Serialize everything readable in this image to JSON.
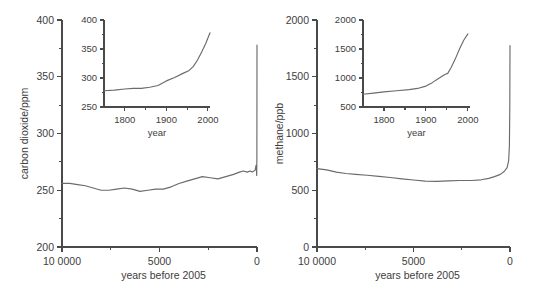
{
  "figure": {
    "background": "#ffffff",
    "line_color": "#6b6b6b",
    "axis_color": "#4a4a4a",
    "text_color": "#3d3d3d"
  },
  "chart_data": [
    {
      "id": "co2-main",
      "type": "line",
      "title": "",
      "xlabel": "years before 2005",
      "ylabel": "carbon dioxide/ppm",
      "xlim": [
        100000,
        0
      ],
      "ylim": [
        200,
        400
      ],
      "x_ticks": [
        100000,
        50000,
        0
      ],
      "x_tick_labels": [
        "10 0000",
        "5000",
        "0"
      ],
      "x_minor_ticks": [
        75000,
        25000
      ],
      "y_ticks": [
        200,
        250,
        300,
        350,
        400
      ],
      "y_tick_labels": [
        "200",
        "250",
        "300",
        "350",
        "400"
      ],
      "y_minor_ticks": [
        225,
        275,
        325,
        375
      ],
      "grid": false,
      "legend": "none",
      "x": [
        100000,
        96000,
        92000,
        88000,
        84000,
        80000,
        76000,
        72000,
        68000,
        64000,
        60000,
        56000,
        52000,
        48000,
        44000,
        40000,
        36000,
        32000,
        28000,
        24000,
        20000,
        16000,
        12000,
        9000,
        7000,
        5000,
        3500,
        2500,
        1500,
        900,
        500,
        300,
        150,
        60,
        0
      ],
      "y": [
        256,
        256,
        255,
        254,
        252,
        250,
        250,
        251,
        252,
        251,
        249,
        250,
        251,
        251,
        253,
        256,
        258,
        260,
        262,
        261,
        260,
        262,
        264,
        266,
        267,
        266,
        267,
        266,
        267,
        268,
        272,
        268,
        263,
        280,
        378
      ]
    },
    {
      "id": "co2-inset",
      "type": "line",
      "title": "",
      "xlabel": "year",
      "ylabel": "",
      "xlim": [
        1750,
        2005
      ],
      "ylim": [
        250,
        400
      ],
      "x_ticks": [
        1800,
        1900,
        2000
      ],
      "x_tick_labels": [
        "1800",
        "1900",
        "2000"
      ],
      "x_minor_ticks": [
        1850,
        1950
      ],
      "y_ticks": [
        250,
        300,
        350,
        400
      ],
      "y_tick_labels": [
        "250",
        "300",
        "350",
        "400"
      ],
      "y_minor_ticks": [
        275,
        325,
        375
      ],
      "grid": false,
      "legend": "none",
      "x": [
        1750,
        1775,
        1800,
        1820,
        1840,
        1860,
        1880,
        1900,
        1920,
        1940,
        1955,
        1965,
        1975,
        1985,
        1995,
        2005
      ],
      "y": [
        278,
        279,
        281,
        282,
        282,
        284,
        287,
        295,
        301,
        308,
        313,
        320,
        331,
        345,
        360,
        378
      ]
    },
    {
      "id": "ch4-main",
      "type": "line",
      "title": "",
      "xlabel": "years before 2005",
      "ylabel": "methane/ppb",
      "xlim": [
        100000,
        0
      ],
      "ylim": [
        0,
        2000
      ],
      "x_ticks": [
        100000,
        50000,
        0
      ],
      "x_tick_labels": [
        "10 0000",
        "5000",
        "0"
      ],
      "x_minor_ticks": [
        75000,
        25000
      ],
      "y_ticks": [
        0,
        500,
        1000,
        1500,
        2000
      ],
      "y_tick_labels": [
        "0",
        "500",
        "1000",
        "1500",
        "2000"
      ],
      "y_minor_ticks": [
        250,
        750,
        1250,
        1750
      ],
      "grid": false,
      "legend": "none",
      "x": [
        100000,
        95000,
        90000,
        85000,
        80000,
        74000,
        68000,
        62000,
        56000,
        50000,
        44000,
        38000,
        32000,
        26000,
        20000,
        15000,
        11000,
        8000,
        5000,
        3000,
        1500,
        700,
        300,
        100,
        0
      ],
      "y": [
        690,
        680,
        660,
        648,
        640,
        632,
        622,
        612,
        600,
        590,
        580,
        578,
        582,
        586,
        586,
        592,
        605,
        620,
        640,
        665,
        700,
        760,
        900,
        1250,
        1774
      ]
    },
    {
      "id": "ch4-inset",
      "type": "line",
      "title": "",
      "xlabel": "year",
      "ylabel": "",
      "xlim": [
        1750,
        2005
      ],
      "ylim": [
        500,
        2000
      ],
      "x_ticks": [
        1800,
        1900,
        2000
      ],
      "x_tick_labels": [
        "1800",
        "1900",
        "2000"
      ],
      "x_minor_ticks": [
        1850,
        1950
      ],
      "y_ticks": [
        500,
        1000,
        1500,
        2000
      ],
      "y_tick_labels": [
        "500",
        "1000",
        "1500",
        "2000"
      ],
      "y_minor_ticks": [
        750,
        1250,
        1750
      ],
      "grid": false,
      "legend": "none",
      "x": [
        1750,
        1775,
        1800,
        1830,
        1860,
        1880,
        1900,
        1915,
        1930,
        1945,
        1952,
        1960,
        1970,
        1980,
        1990,
        2000
      ],
      "y": [
        720,
        740,
        760,
        780,
        800,
        820,
        860,
        920,
        990,
        1060,
        1080,
        1180,
        1330,
        1500,
        1650,
        1760
      ]
    }
  ]
}
